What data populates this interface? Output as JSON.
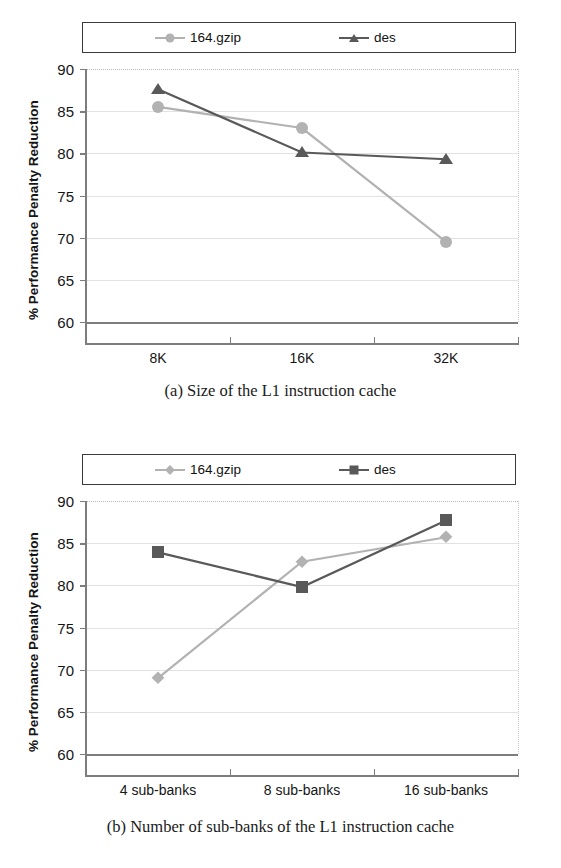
{
  "figures": [
    {
      "id": "a",
      "caption": "(a) Size of the L1 instruction cache",
      "legend": [
        {
          "label": "164.gzip",
          "marker": "circle",
          "color": "#b2b2b2"
        },
        {
          "label": "des",
          "marker": "triangle",
          "color": "#595959"
        }
      ],
      "chart_data": {
        "type": "line",
        "title": "",
        "xlabel": "",
        "ylabel": "% Performance Penalty Reduction",
        "categories": [
          "8K",
          "16K",
          "32K"
        ],
        "ylim": [
          60,
          90
        ],
        "yticks": [
          60,
          65,
          70,
          75,
          80,
          85,
          90
        ],
        "grid": true,
        "legend_position": "top",
        "series": [
          {
            "name": "164.gzip",
            "marker": "circle",
            "color": "#b2b2b2",
            "values": [
              85.5,
              83.0,
              69.5
            ]
          },
          {
            "name": "des",
            "marker": "triangle",
            "color": "#595959",
            "values": [
              87.6,
              80.1,
              79.3
            ]
          }
        ]
      }
    },
    {
      "id": "b",
      "caption": "(b) Number of sub-banks of the L1 instruction cache",
      "legend": [
        {
          "label": "164.gzip",
          "marker": "diamond",
          "color": "#b2b2b2"
        },
        {
          "label": "des",
          "marker": "square",
          "color": "#595959"
        }
      ],
      "chart_data": {
        "type": "line",
        "title": "",
        "xlabel": "",
        "ylabel": "% Performance Penalty Reduction",
        "categories": [
          "4 sub-banks",
          "8 sub-banks",
          "16 sub-banks"
        ],
        "ylim": [
          60,
          90
        ],
        "yticks": [
          60,
          65,
          70,
          75,
          80,
          85,
          90
        ],
        "grid": true,
        "legend_position": "top",
        "series": [
          {
            "name": "164.gzip",
            "marker": "diamond",
            "color": "#b2b2b2",
            "values": [
              69.0,
              82.8,
              85.7
            ]
          },
          {
            "name": "des",
            "marker": "square",
            "color": "#595959",
            "values": [
              83.9,
              79.8,
              87.7
            ]
          }
        ]
      }
    }
  ]
}
